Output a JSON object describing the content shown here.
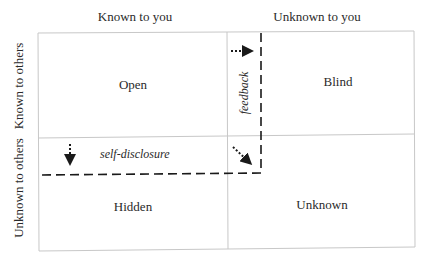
{
  "diagram": {
    "type": "johari-window",
    "column_headers": [
      "Known to you",
      "Unknown to you"
    ],
    "row_headers": [
      "Known to others",
      "Unknown to others"
    ],
    "quadrants": {
      "top_left": "Open",
      "top_right": "Blind",
      "bottom_left": "Hidden",
      "bottom_right": "Unknown"
    },
    "arrows": {
      "feedback": "feedback",
      "self_disclosure": "self-disclosure"
    },
    "colors": {
      "grid_line": "#c8c8c8",
      "dashed_line": "#1a1a1a",
      "text": "#2a2a2a"
    }
  }
}
